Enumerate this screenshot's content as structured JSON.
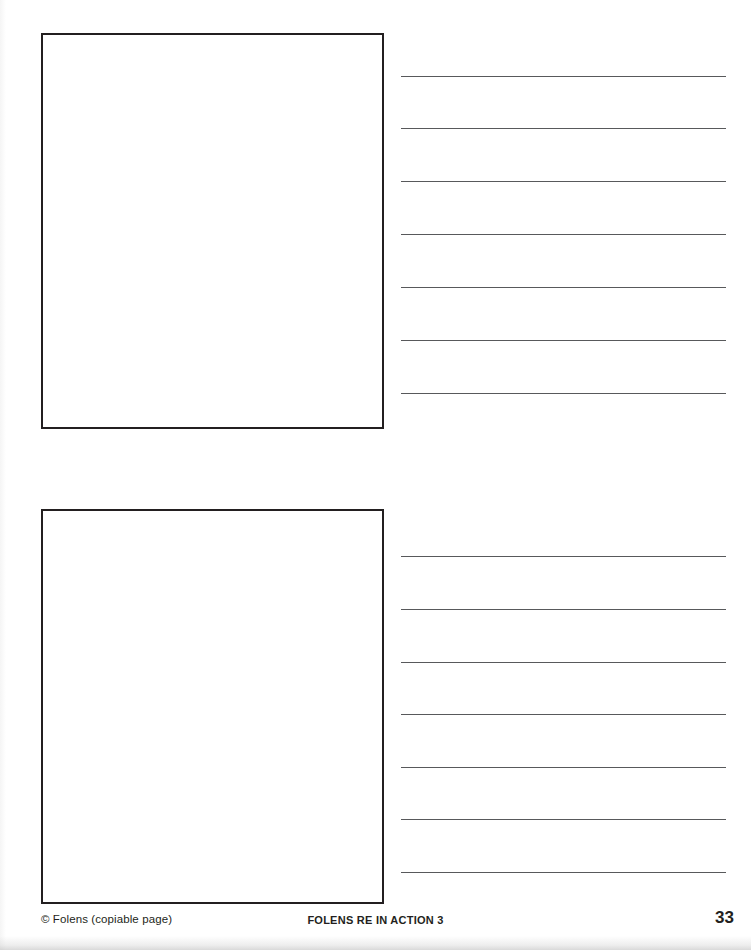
{
  "page": {
    "background_color": "#ffffff",
    "ink_color": "#231f20",
    "rule_color": "#58595b",
    "width": 751,
    "height": 950
  },
  "worksheet": {
    "sections": [
      {
        "name": "section-1",
        "drawing_box": {
          "label": "drawing-area",
          "x": 41,
          "y": 33,
          "width": 343,
          "height": 396,
          "border_color": "#231f20",
          "border_width": 2,
          "content": ""
        },
        "writing_lines": {
          "label": "writing-lines",
          "count": 7,
          "x": 401,
          "width": 325,
          "spacing": 52.6,
          "offsets": [
            0,
            52,
            105,
            158,
            211,
            264,
            317
          ],
          "values": [
            "",
            "",
            "",
            "",
            "",
            "",
            ""
          ]
        }
      },
      {
        "name": "section-2",
        "drawing_box": {
          "label": "drawing-area",
          "x": 41,
          "y": 509,
          "width": 343,
          "height": 395,
          "border_color": "#231f20",
          "border_width": 2,
          "content": ""
        },
        "writing_lines": {
          "label": "writing-lines",
          "count": 7,
          "x": 401,
          "width": 325,
          "spacing": 52.6,
          "offsets": [
            0,
            53,
            106,
            158,
            211,
            263,
            316
          ],
          "values": [
            "",
            "",
            "",
            "",
            "",
            "",
            ""
          ]
        }
      }
    ]
  },
  "footer": {
    "copyright": "© Folens (copiable page)",
    "title": "FOLENS RE IN ACTION 3",
    "page_number": "33"
  }
}
